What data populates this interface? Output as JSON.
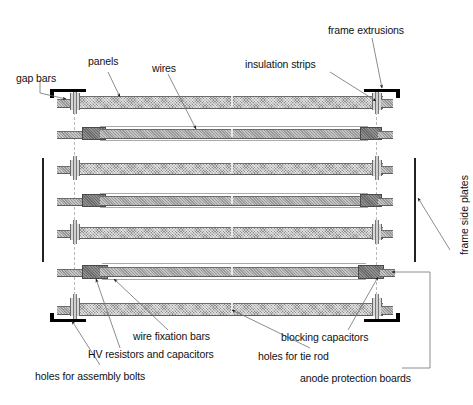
{
  "figure": {
    "type": "technical-assembly-diagram"
  },
  "labels": {
    "gap_bars": "gap bars",
    "panels": "panels",
    "wires": "wires",
    "insulation_strips": "insulation strips",
    "frame_extrusions": "frame extrusions",
    "frame_side_plates": "frame side plates",
    "wire_fixation_bars": "wire fixation bars",
    "hv_resistors_and_capacitors": "HV resistors and capacitors",
    "holes_for_assembly_bolts": "holes for assembly bolts",
    "holes_for_tie_rod": "holes for tie rod",
    "blocking_capacitors": "blocking capacitors",
    "anode_protection_boards": "anode protection boards"
  },
  "colors": {
    "background": "#ffffff",
    "ink": "#111111",
    "bar_fill": "#8e8e8e",
    "bar_fill_light": "#9a9a9a",
    "fitting_fill": "#6a6a6a",
    "flange_fill": "#d8d8d8",
    "leader_line": "#6f6f6f",
    "centre_line": "#b9b9b9",
    "side_plate": "#222222",
    "bracket": "#000000"
  },
  "structure": {
    "bolt_columns_x": [
      74,
      376
    ],
    "rows": [
      {
        "name": "top-panel-bar",
        "kind": "bar",
        "y": 96,
        "height": 11
      },
      {
        "name": "wire-row-1",
        "kind": "wire",
        "y": 128,
        "height": 10
      },
      {
        "name": "panel-bar-2",
        "kind": "bar",
        "y": 163,
        "height": 10
      },
      {
        "name": "wire-row-2",
        "kind": "wire",
        "y": 195,
        "height": 10
      },
      {
        "name": "panel-bar-3",
        "kind": "bar",
        "y": 227,
        "height": 10
      },
      {
        "name": "wire-row-3",
        "kind": "wire",
        "y": 266,
        "height": 10
      },
      {
        "name": "bottom-panel-bar",
        "kind": "bar",
        "y": 303,
        "height": 11
      }
    ],
    "side_plates": [
      {
        "name": "left-frame-side-plate",
        "x": 42,
        "y": 158,
        "height": 104
      },
      {
        "name": "right-frame-side-plate",
        "x": 414,
        "y": 158,
        "height": 104
      }
    ],
    "gap_bar_brackets": [
      {
        "name": "top-left-gap-bar-bracket",
        "corner": "top-left"
      },
      {
        "name": "top-right-gap-bar-bracket",
        "corner": "top-right"
      },
      {
        "name": "bottom-left-gap-bar-bracket",
        "corner": "bottom-left"
      },
      {
        "name": "bottom-right-gap-bar-bracket",
        "corner": "bottom-right"
      }
    ]
  }
}
